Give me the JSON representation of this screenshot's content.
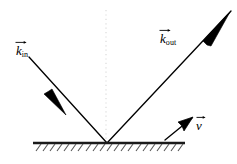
{
  "figure": {
    "kind": "physics-vector-diagram",
    "width": 237,
    "height": 164,
    "background_color": "#ffffff"
  },
  "colors": {
    "stroke": "#000000",
    "surface": "#1a1a1a",
    "hatch": "#555555",
    "normal_dashed": "#d8d8d8"
  },
  "labels": {
    "k_in": {
      "symbol": "k",
      "subscript": "in",
      "has_vector_arrow": true,
      "name": "incoming-wavevector-label"
    },
    "k_out": {
      "symbol": "k",
      "subscript": "out",
      "has_vector_arrow": true,
      "name": "outgoing-wavevector-label"
    },
    "v": {
      "symbol": "v",
      "subscript": "",
      "has_vector_arrow": true,
      "name": "velocity-label"
    }
  },
  "geometry": {
    "origin": {
      "x": 107,
      "y": 143
    },
    "surface_line": {
      "x1": 33,
      "y1": 143,
      "x2": 185,
      "y2": 143,
      "width": 2.4
    },
    "hatch": {
      "count": 21,
      "start_x": 36,
      "spacing": 7.1,
      "dx": 5,
      "dy": 7,
      "y_top": 144,
      "width": 1.1
    },
    "normal_line": {
      "x1": 106,
      "y1": 10,
      "x2": 106,
      "y2": 143,
      "dash": "1,3",
      "width": 1.1
    },
    "k_in_line": {
      "x1": 29,
      "y1": 57,
      "x2": 107,
      "y2": 143,
      "width": 1.3
    },
    "k_in_arrowhead": {
      "cx": 53,
      "cy": 100,
      "angle_deg": 47.8,
      "length": 21,
      "half_width": 3.6
    },
    "k_out_line": {
      "x1": 107,
      "y1": 143,
      "x2": 231,
      "y2": 11,
      "width": 1.3
    },
    "k_out_arrowhead": {
      "cx": 213,
      "cy": 30,
      "angle_deg": -46.8,
      "length": 27,
      "half_width": 4.2
    },
    "v_line": {
      "x1": 165,
      "y1": 139,
      "x2": 193,
      "y2": 117,
      "width": 1.3
    },
    "v_arrowhead": {
      "cx": 190,
      "cy": 119,
      "angle_deg": -38,
      "length": 15,
      "half_width": 5.2
    }
  }
}
